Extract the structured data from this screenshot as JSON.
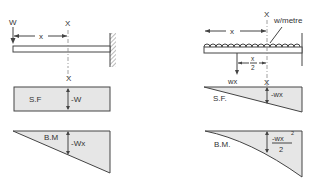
{
  "left_case": {
    "title": "Cantilever with point load at free end",
    "load_label": "W",
    "section_label": "X",
    "distance_label": "x",
    "sf_label": "S.F",
    "sf_value": "-W",
    "bm_label": "B.M",
    "bm_value": "-Wx"
  },
  "right_case": {
    "title": "Cantilever with uniformly distributed load",
    "load_label": "w/metre",
    "section_label": "X",
    "distance_label": "x",
    "half_distance_num": "x",
    "half_distance_den": "2",
    "resultant_label": "wx",
    "section_label_2": "X",
    "sf_label": "S.F.",
    "sf_value": "-wx",
    "bm_label": "B.M.",
    "bm_value_num": "-wx",
    "bm_value_exp": "2",
    "bm_value_den": "2"
  },
  "colors": {
    "line": "#444444",
    "fill": "#e6e6e6",
    "text": "#333333"
  }
}
